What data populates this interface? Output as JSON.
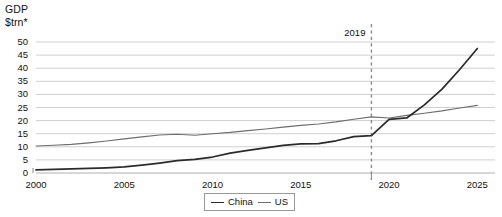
{
  "chart_data": {
    "type": "line",
    "title": "",
    "ylabel": "GDP $trn*",
    "ylabel_line1": "GDP",
    "ylabel_line2": "$trn*",
    "xlabel": "",
    "ylim": [
      0,
      50
    ],
    "xlim": [
      2000,
      2026
    ],
    "yticks": [
      0,
      5,
      10,
      15,
      20,
      25,
      30,
      35,
      40,
      45,
      50
    ],
    "ytick_labels": [
      "0",
      "5",
      "10",
      "15",
      "20",
      "25",
      "30",
      "35",
      "40",
      "45",
      "50"
    ],
    "xticks": [
      2000,
      2005,
      2010,
      2015,
      2020,
      2025
    ],
    "xtick_labels": [
      "2000",
      "2005",
      "2010",
      "2015",
      "2020",
      "2025"
    ],
    "grid": "horizontal",
    "legend_position": "bottom-center",
    "x": [
      2000,
      2001,
      2002,
      2003,
      2004,
      2005,
      2006,
      2007,
      2008,
      2009,
      2010,
      2011,
      2012,
      2013,
      2014,
      2015,
      2016,
      2017,
      2018,
      2019,
      2020,
      2021,
      2022,
      2023,
      2024,
      2025
    ],
    "series": [
      {
        "name": "China",
        "color": "#2b2b2b",
        "values": [
          1.2,
          1.4,
          1.6,
          1.8,
          2.0,
          2.3,
          3.0,
          3.8,
          4.7,
          5.2,
          6.1,
          7.6,
          8.6,
          9.6,
          10.5,
          11.1,
          11.2,
          12.3,
          13.9,
          14.3,
          20.5,
          21.0,
          26.0,
          32.0,
          39.5,
          47.5
        ]
      },
      {
        "name": "US",
        "color": "#6e6e6e",
        "values": [
          10.3,
          10.6,
          10.9,
          11.5,
          12.2,
          13.0,
          13.8,
          14.5,
          14.8,
          14.4,
          15.0,
          15.5,
          16.2,
          16.8,
          17.5,
          18.2,
          18.7,
          19.5,
          20.5,
          21.4,
          21.0,
          22.0,
          22.8,
          23.7,
          24.8,
          25.8
        ]
      }
    ],
    "annotations": [
      {
        "label": "2019",
        "x": 2019,
        "style": "dashed-vertical-line"
      }
    ]
  }
}
